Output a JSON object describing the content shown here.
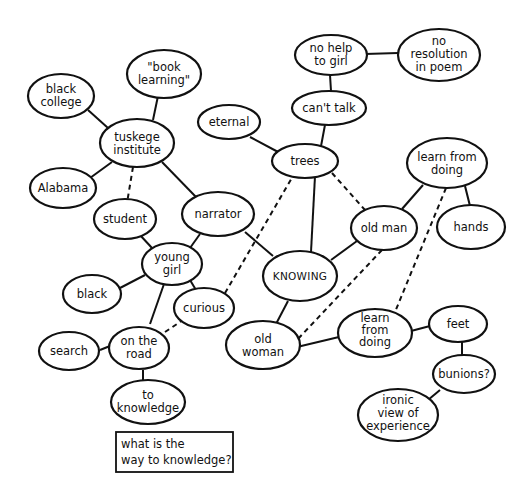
{
  "diagram": {
    "type": "concept-map",
    "question_box": {
      "lines": [
        "what is the",
        "way to knowledge?"
      ]
    },
    "nodes": [
      {
        "id": "book_learning",
        "lines": [
          "\"book",
          "learning\""
        ]
      },
      {
        "id": "black_college",
        "lines": [
          "black",
          "college"
        ]
      },
      {
        "id": "tuskege_institute",
        "lines": [
          "tuskege",
          "institute"
        ]
      },
      {
        "id": "alabama",
        "lines": [
          "Alabama"
        ]
      },
      {
        "id": "student",
        "lines": [
          "student"
        ]
      },
      {
        "id": "narrator",
        "lines": [
          "narrator"
        ]
      },
      {
        "id": "young_girl",
        "lines": [
          "young",
          "girl"
        ]
      },
      {
        "id": "black",
        "lines": [
          "black"
        ]
      },
      {
        "id": "curious",
        "lines": [
          "curious"
        ]
      },
      {
        "id": "on_the_road",
        "lines": [
          "on the",
          "road"
        ]
      },
      {
        "id": "search",
        "lines": [
          "search"
        ]
      },
      {
        "id": "to_knowledge",
        "lines": [
          "to",
          "knowledge"
        ]
      },
      {
        "id": "eternal",
        "lines": [
          "eternal"
        ]
      },
      {
        "id": "trees",
        "lines": [
          "trees"
        ]
      },
      {
        "id": "cant_talk",
        "lines": [
          "can't talk"
        ]
      },
      {
        "id": "no_help_to_girl",
        "lines": [
          "no help",
          "to girl"
        ]
      },
      {
        "id": "no_resolution",
        "lines": [
          "no",
          "resolution",
          "in poem"
        ]
      },
      {
        "id": "knowing",
        "lines": [
          "KNOWING"
        ]
      },
      {
        "id": "old_man",
        "lines": [
          "old man"
        ]
      },
      {
        "id": "learn_from_doing_top",
        "lines": [
          "learn from",
          "doing"
        ]
      },
      {
        "id": "hands",
        "lines": [
          "hands"
        ]
      },
      {
        "id": "old_woman",
        "lines": [
          "old",
          "woman"
        ]
      },
      {
        "id": "learn_from_doing_bottom",
        "lines": [
          "learn",
          "from",
          "doing"
        ]
      },
      {
        "id": "feet",
        "lines": [
          "feet"
        ]
      },
      {
        "id": "bunions",
        "lines": [
          "bunions?"
        ]
      },
      {
        "id": "ironic_view",
        "lines": [
          "ironic",
          "view of",
          "experience"
        ]
      }
    ],
    "edges": [
      {
        "from": "tuskege_institute",
        "to": "book_learning",
        "style": "solid"
      },
      {
        "from": "tuskege_institute",
        "to": "black_college",
        "style": "solid"
      },
      {
        "from": "tuskege_institute",
        "to": "alabama",
        "style": "solid"
      },
      {
        "from": "tuskege_institute",
        "to": "student",
        "style": "dashed"
      },
      {
        "from": "tuskege_institute",
        "to": "narrator",
        "style": "solid"
      },
      {
        "from": "student",
        "to": "young_girl",
        "style": "solid"
      },
      {
        "from": "narrator",
        "to": "young_girl",
        "style": "solid"
      },
      {
        "from": "narrator",
        "to": "knowing",
        "style": "solid"
      },
      {
        "from": "young_girl",
        "to": "black",
        "style": "solid"
      },
      {
        "from": "young_girl",
        "to": "curious",
        "style": "solid"
      },
      {
        "from": "young_girl",
        "to": "on_the_road",
        "style": "solid"
      },
      {
        "from": "on_the_road",
        "to": "search",
        "style": "solid"
      },
      {
        "from": "on_the_road",
        "to": "to_knowledge",
        "style": "solid"
      },
      {
        "from": "on_the_road",
        "to": "curious",
        "style": "dashed"
      },
      {
        "from": "curious",
        "to": "trees",
        "style": "dashed"
      },
      {
        "from": "eternal",
        "to": "trees",
        "style": "solid"
      },
      {
        "from": "trees",
        "to": "cant_talk",
        "style": "solid"
      },
      {
        "from": "cant_talk",
        "to": "no_help_to_girl",
        "style": "solid"
      },
      {
        "from": "no_help_to_girl",
        "to": "no_resolution",
        "style": "solid"
      },
      {
        "from": "trees",
        "to": "knowing",
        "style": "solid"
      },
      {
        "from": "trees",
        "to": "old_man",
        "style": "dashed"
      },
      {
        "from": "knowing",
        "to": "old_man",
        "style": "solid"
      },
      {
        "from": "knowing",
        "to": "old_woman",
        "style": "solid"
      },
      {
        "from": "old_man",
        "to": "learn_from_doing_top",
        "style": "solid"
      },
      {
        "from": "old_man",
        "to": "old_woman",
        "style": "dashed"
      },
      {
        "from": "learn_from_doing_top",
        "to": "hands",
        "style": "solid"
      },
      {
        "from": "learn_from_doing_top",
        "to": "learn_from_doing_bottom",
        "style": "dashed"
      },
      {
        "from": "old_woman",
        "to": "learn_from_doing_bottom",
        "style": "solid"
      },
      {
        "from": "learn_from_doing_bottom",
        "to": "feet",
        "style": "solid"
      },
      {
        "from": "feet",
        "to": "bunions",
        "style": "solid"
      },
      {
        "from": "bunions",
        "to": "ironic_view",
        "style": "solid"
      }
    ]
  }
}
